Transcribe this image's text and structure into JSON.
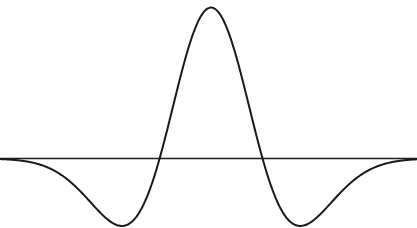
{
  "figure": {
    "background_color": "#ffffff",
    "width": 417,
    "height": 228,
    "title": "",
    "caption": ""
  },
  "chart_data": {
    "type": "line",
    "title": "",
    "subtitle": "",
    "xlabel": "",
    "ylabel": "",
    "function_name": "Mexican hat wavelet",
    "function_expression": "psi(t) = (1 - t^2) * exp(-t^2 / 2)",
    "grid": false,
    "legend": false,
    "legend_position": "none",
    "xlim": [
      -4.1,
      4.0
    ],
    "ylim": [
      -0.46,
      1.05
    ],
    "axis_line": {
      "orientation": "horizontal",
      "y_value": 0,
      "x_start": -4.1,
      "x_end": 4.0,
      "color": "#1c1c1c",
      "width_px": 1.6
    },
    "series": [
      {
        "name": "psi(t)",
        "color": "#1a1a1a",
        "line_width_px": 2.0,
        "x": [
          -4.1,
          -3.95,
          -3.8,
          -3.65,
          -3.5,
          -3.35,
          -3.2,
          -3.05,
          -2.9,
          -2.75,
          -2.6,
          -2.45,
          -2.3,
          -2.15,
          -2.0,
          -1.85,
          -1.7,
          -1.55,
          -1.4,
          -1.25,
          -1.1,
          -1.0,
          -0.9,
          -0.75,
          -0.6,
          -0.45,
          -0.3,
          -0.15,
          0.0,
          0.15,
          0.3,
          0.45,
          0.6,
          0.75,
          0.9,
          1.0,
          1.1,
          1.25,
          1.4,
          1.55,
          1.7,
          1.85,
          2.0,
          2.15,
          2.3,
          2.45,
          2.6,
          2.75,
          2.9,
          3.05,
          3.2,
          3.35,
          3.5,
          3.65,
          3.8,
          3.95,
          4.0
        ],
        "y": [
          -0.024,
          -0.034,
          -0.047,
          -0.064,
          -0.085,
          -0.111,
          -0.142,
          -0.178,
          -0.219,
          -0.265,
          -0.313,
          -0.362,
          -0.409,
          -0.45,
          -0.483,
          -0.502,
          -0.505,
          -0.487,
          -0.446,
          -0.379,
          -0.286,
          -0.213,
          -0.132,
          0.012,
          0.17,
          0.324,
          0.461,
          0.568,
          0.638,
          0.568,
          0.461,
          0.324,
          0.17,
          0.012,
          -0.132,
          -0.213,
          -0.286,
          -0.379,
          -0.446,
          -0.487,
          -0.505,
          -0.502,
          -0.483,
          -0.45,
          -0.409,
          -0.362,
          -0.313,
          -0.265,
          -0.219,
          -0.178,
          -0.142,
          -0.111,
          -0.085,
          -0.064,
          -0.047,
          -0.034,
          -0.024
        ],
        "key_points": {
          "peak": {
            "x": 0.0,
            "y": 1.0,
            "pixel": [
              211,
              11
            ]
          },
          "zero_crossings": [
            {
              "x": -1.0,
              "pixel": [
                162,
                160
              ]
            },
            {
              "x": 1.0,
              "pixel": [
                260,
                160
              ]
            }
          ],
          "troughs": [
            {
              "x": -1.73,
              "y": -0.446,
              "pixel": [
                137,
                216
              ]
            },
            {
              "x": 1.73,
              "y": -0.446,
              "pixel": [
                286,
                216
              ]
            }
          ]
        }
      }
    ],
    "xticks": [],
    "xticklabels": [],
    "yticks": [],
    "yticklabels": [],
    "annotations": []
  }
}
